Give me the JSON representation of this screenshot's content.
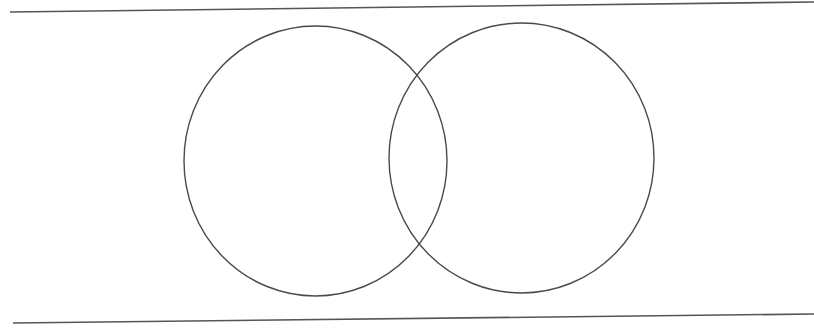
{
  "diagram": {
    "type": "venn",
    "background": "#ffffff",
    "line_color": "#555555",
    "rules": {
      "top": {
        "x1": 10,
        "y1": 12,
        "x2": 814,
        "y2": 2
      },
      "bottom": {
        "x1": 13,
        "y1": 323,
        "x2": 814,
        "y2": 314
      }
    },
    "sets": [
      {
        "id": "set-a",
        "label": "",
        "cx": 315.5,
        "cy": 161,
        "rx": 131.5,
        "ry": 135
      },
      {
        "id": "set-b",
        "label": "",
        "cx": 521.5,
        "cy": 158,
        "rx": 132.5,
        "ry": 135
      }
    ]
  }
}
